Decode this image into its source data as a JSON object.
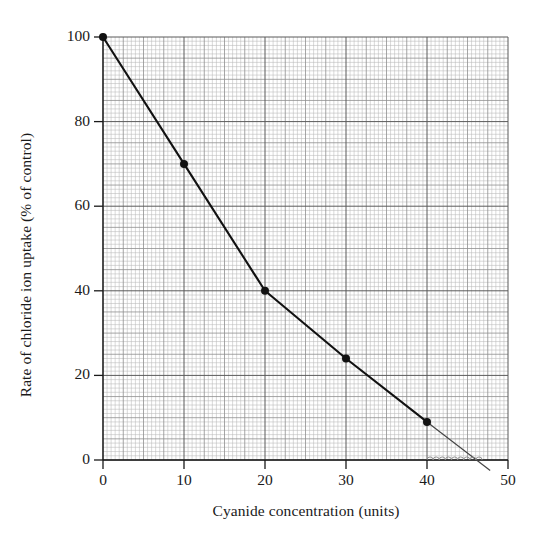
{
  "figure": {
    "background_color": "#ffffff",
    "ink_color": "#1a1a1a",
    "grid_minor_color": "#b9b9b9",
    "grid_mid_color": "#8f8f8f",
    "grid_major_color": "#5a5a5a",
    "curve_color": "#111111",
    "extrapolation_color": "#444444"
  },
  "chart_data": {
    "type": "line",
    "title": "",
    "subtitle": "",
    "xlabel": "Cyanide concentration (units)",
    "ylabel": "Rate of chloride ion uptake (% of control)",
    "xlim": [
      0,
      50
    ],
    "ylim": [
      0,
      100
    ],
    "xticks": [
      0,
      10,
      20,
      30,
      40,
      50
    ],
    "xtick_labels": [
      "0",
      "10",
      "20",
      "30",
      "40",
      "50"
    ],
    "yticks": [
      0,
      20,
      40,
      60,
      80,
      100
    ],
    "ytick_labels": [
      "0",
      "20",
      "40",
      "60",
      "80",
      "100"
    ],
    "grid": true,
    "grid_style": "graph-paper",
    "grid_minor_step_x": 0.5,
    "grid_minor_step_y": 1,
    "grid_mid_step_x": 2.5,
    "grid_mid_step_y": 5,
    "grid_major_step_x": 10,
    "grid_major_step_y": 20,
    "legend": false,
    "legend_position": "none",
    "series": [
      {
        "name": "Rate of chloride ion uptake",
        "marker": "filled-circle",
        "x": [
          0,
          10,
          20,
          30,
          40
        ],
        "y": [
          100,
          70,
          40,
          24,
          9
        ]
      }
    ],
    "annotations": [
      {
        "name": "extrapolation-line",
        "type": "extrapolation",
        "from_x": 40,
        "from_y": 9,
        "to_x": 47.8,
        "to_y": -2.5,
        "x_intercept": 47
      },
      {
        "name": "scallop-bracket",
        "type": "scallop-marks",
        "from_x": 40,
        "to_x": 46.8,
        "at_y": 0,
        "count": 9
      }
    ]
  }
}
